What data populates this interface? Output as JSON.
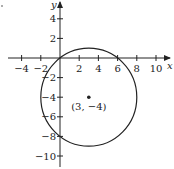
{
  "chart_data": {
    "type": "scatter",
    "title": "",
    "xlabel": "x",
    "ylabel": "y",
    "xlim": [
      -5,
      11
    ],
    "ylim": [
      -11,
      5.5
    ],
    "grid": false,
    "x_ticks": [
      -4,
      -2,
      2,
      4,
      6,
      8,
      10
    ],
    "y_ticks": [
      4,
      2,
      -2,
      -4,
      -6,
      -8,
      -10
    ],
    "x_tick_labels": [
      "−4",
      "−2",
      "2",
      "4",
      "6",
      "8",
      "10"
    ],
    "y_tick_labels": [
      "4",
      "2",
      "−2",
      "−4",
      "−6",
      "−8",
      "−10"
    ],
    "circle": {
      "center": [
        3,
        -4
      ],
      "radius": 5
    },
    "points": [
      {
        "x": 3,
        "y": -4,
        "label": "(3, −4)"
      }
    ],
    "annotations": [
      {
        "text": "(3, −4)",
        "x": 3,
        "y": -4.9
      }
    ]
  },
  "colors": {
    "line": "#222222",
    "background": "#ffffff"
  }
}
